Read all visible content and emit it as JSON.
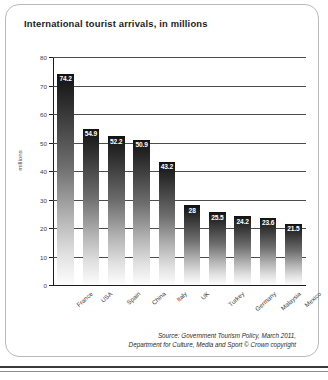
{
  "card": {
    "title": "International tourist arrivals, in millions"
  },
  "source": {
    "line1": "Source: Government Tourism Policy, March 2011,",
    "line2": "Department for Culture, Media and Sport © Crown copyright"
  },
  "chart_data": {
    "type": "bar",
    "title": "International tourist arrivals, in millions",
    "xlabel": "",
    "ylabel": "millions",
    "ylim": [
      0,
      80
    ],
    "ytick_step": 10,
    "yticks": [
      "0",
      "10",
      "20",
      "30",
      "40",
      "50",
      "60",
      "70",
      "80"
    ],
    "grid": true,
    "legend": "none",
    "categories": [
      "France",
      "USA",
      "Spain",
      "China",
      "Italy",
      "UK",
      "Turkey",
      "Germany",
      "Malaysia",
      "Mexico"
    ],
    "values": [
      74.2,
      54.9,
      52.2,
      50.9,
      43.2,
      28,
      25.5,
      24.2,
      23.6,
      21.5
    ],
    "value_labels": [
      "74.2",
      "54.9",
      "52.2",
      "50.9",
      "43.2",
      "28",
      "25.5",
      "24.2",
      "23.6",
      "21.5"
    ],
    "bar_gradient": {
      "top": "#121212",
      "bottom": "#fdfdfd"
    },
    "label_color": "#ffffff",
    "axis_color": "#1c1c1c"
  }
}
